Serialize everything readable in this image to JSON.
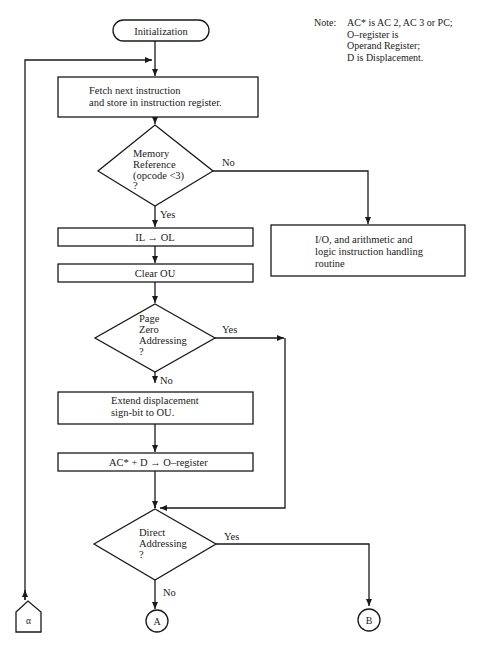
{
  "note": {
    "label": "Note:",
    "lines": [
      "AC* is AC 2, AC 3 or PC;",
      "O–register is",
      "Operand Register;",
      "D is Displacement."
    ]
  },
  "nodes": {
    "start": {
      "type": "terminal",
      "label": "Initialization"
    },
    "fetch": {
      "type": "process",
      "lines": [
        "Fetch next instruction",
        "and store in instruction register."
      ]
    },
    "mem_ref": {
      "type": "decision",
      "lines": [
        "Memory",
        "Reference",
        "(opcode  <3)",
        "?"
      ]
    },
    "io_routine": {
      "type": "process",
      "lines": [
        "I/O, and arithmetic and",
        "logic instruction handling",
        "routine"
      ]
    },
    "il_ol": {
      "type": "process",
      "label": "IL → OL"
    },
    "clear_ou": {
      "type": "process",
      "label": "Clear OU"
    },
    "page_zero": {
      "type": "decision",
      "lines": [
        "Page",
        "Zero",
        "Addressing",
        "?"
      ]
    },
    "extend": {
      "type": "process",
      "lines": [
        "Extend displacement",
        "sign-bit to OU."
      ]
    },
    "ac_d": {
      "type": "process",
      "label": "AC* + D → O–register"
    },
    "direct": {
      "type": "decision",
      "lines": [
        "Direct",
        "Addressing",
        "?"
      ]
    },
    "conn_a": {
      "type": "connector",
      "label": "A"
    },
    "conn_b": {
      "type": "connector",
      "label": "B"
    },
    "conn_alpha": {
      "type": "off-page-connector",
      "label": "α"
    }
  },
  "edges": {
    "mem_ref_no": "No",
    "mem_ref_yes": "Yes",
    "page_zero_yes": "Yes",
    "page_zero_no": "No",
    "direct_yes": "Yes",
    "direct_no": "No"
  },
  "colors": {
    "line": "#1a1a1a",
    "background": "#ffffff"
  }
}
